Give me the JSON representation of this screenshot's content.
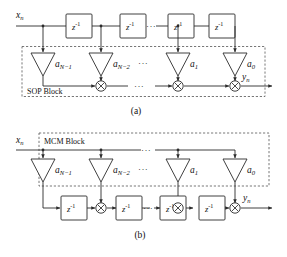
{
  "figure": {
    "ink_color": "#2b2b2b",
    "dash_color": "#555555",
    "background": "#ffffff"
  },
  "labels": {
    "delay": "z",
    "delay_exponent": "-1",
    "ellipsis": "···"
  },
  "panels": [
    {
      "id": "panel-a",
      "caption": "(a)",
      "block_label": "SOP Block",
      "input_label": "x",
      "input_sub": "n",
      "output_label": "y",
      "output_sub": "n",
      "taps": [
        {
          "coef": "a",
          "sub": "N−1"
        },
        {
          "coef": "a",
          "sub": "N−2"
        },
        {
          "coef": "a",
          "sub": "1"
        },
        {
          "coef": "a",
          "sub": "0"
        }
      ],
      "delay_count": 4,
      "adder_count": 3,
      "description": "Delay line on top; multipliers feed a sum-of-products adder chain inside the dashed SOP Block."
    },
    {
      "id": "panel-b",
      "caption": "(b)",
      "block_label": "MCM Block",
      "input_label": "x",
      "input_sub": "n",
      "output_label": "y",
      "output_sub": "n",
      "taps": [
        {
          "coef": "a",
          "sub": "N−1"
        },
        {
          "coef": "a",
          "sub": "N−2"
        },
        {
          "coef": "a",
          "sub": "1"
        },
        {
          "coef": "a",
          "sub": "0"
        }
      ],
      "delay_count": 4,
      "adder_count": 3,
      "description": "Input broadcast to a multiple-constant-multiplication block; outputs merge into a transposed delay-and-add chain."
    }
  ]
}
